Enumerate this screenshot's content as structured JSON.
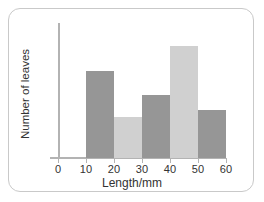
{
  "chart_data": {
    "type": "bar",
    "title": "",
    "xlabel": "Length/mm",
    "ylabel": "Number of leaves",
    "grid": false,
    "legend": false,
    "xlim": [
      0,
      60
    ],
    "xticks": [
      0,
      10,
      20,
      30,
      40,
      50,
      60
    ],
    "xticklabels": [
      "0",
      "10",
      "20",
      "30",
      "40",
      "50",
      "60"
    ],
    "yticks": [],
    "yticklabels": [],
    "bin_edges": [
      10,
      20,
      30,
      40,
      50,
      60
    ],
    "categories": [
      "10-20",
      "20-30",
      "30-40",
      "40-50",
      "50-60"
    ],
    "values": [
      6.2,
      2.9,
      4.5,
      8.0,
      3.4
    ],
    "ylim": [
      0,
      9.6
    ],
    "bar_colors": [
      "#969696",
      "#d0d0d0",
      "#969696",
      "#d0d0d0",
      "#969696"
    ],
    "colors": {
      "bar_dark": "#969696",
      "bar_light": "#d0d0d0",
      "axis": "#b3b3b3",
      "text": "#333333",
      "card_border": "#c9c9c9",
      "background": "#ffffff"
    }
  }
}
